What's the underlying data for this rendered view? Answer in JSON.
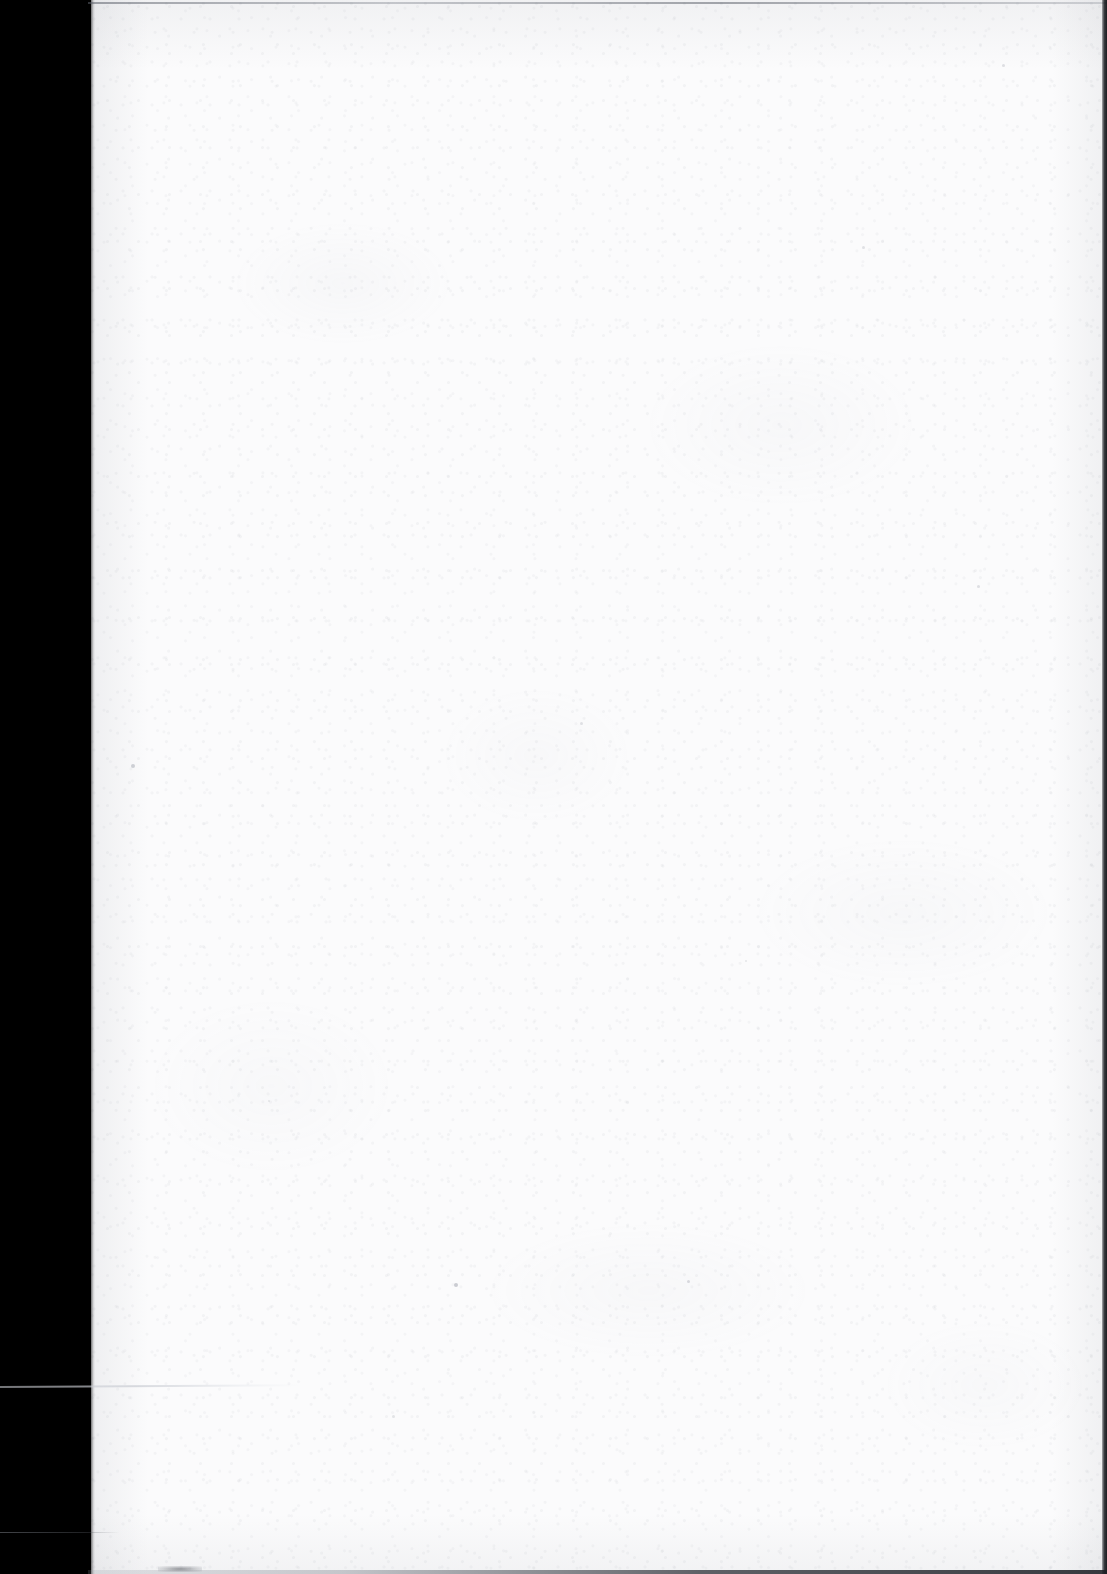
{
  "document": {
    "kind": "scanned-page-image",
    "page_content": "",
    "visible_text": "",
    "description": "Blank scanned book page with black scanner gutter along the left edge",
    "page_number": "",
    "width_px": 1107,
    "height_px": 1574
  },
  "colors": {
    "scanner_margin": "#000000",
    "paper": "#fbfbfc",
    "paper_shadow": "#e9eaec",
    "edge_line": "#2a2c32",
    "speck": "#9a9ea8"
  },
  "regions": {
    "scanner_margin": {
      "label": "scanner gutter",
      "x": 0,
      "y": 0,
      "width": 91,
      "height": 1574
    },
    "paper_sheet": {
      "label": "page",
      "x": 88,
      "y": 0,
      "width": 1019,
      "height": 1574
    }
  },
  "artifacts": {
    "top_edge_line": "page top edge hairline",
    "right_edge_line": "page right edge dark band",
    "bottom_edge_line": "page bottom edge dark band",
    "light_streak": "thin light scan streak across gutter",
    "bottom_smudge": "faint dark smudge at bottom edge",
    "specks": [
      {
        "x": 131,
        "y": 764,
        "size": 4,
        "opacity": 0.45
      },
      {
        "x": 454,
        "y": 1283,
        "size": 4,
        "opacity": 0.5
      },
      {
        "x": 687,
        "y": 1280,
        "size": 3,
        "opacity": 0.35
      },
      {
        "x": 977,
        "y": 585,
        "size": 3,
        "opacity": 0.3
      },
      {
        "x": 1002,
        "y": 64,
        "size": 3,
        "opacity": 0.3
      },
      {
        "x": 580,
        "y": 722,
        "size": 3,
        "opacity": 0.28
      },
      {
        "x": 392,
        "y": 1415,
        "size": 3,
        "opacity": 0.25
      },
      {
        "x": 862,
        "y": 246,
        "size": 3,
        "opacity": 0.28
      },
      {
        "x": 268,
        "y": 1100,
        "size": 2,
        "opacity": 0.22
      },
      {
        "x": 745,
        "y": 960,
        "size": 2,
        "opacity": 0.22
      }
    ]
  }
}
